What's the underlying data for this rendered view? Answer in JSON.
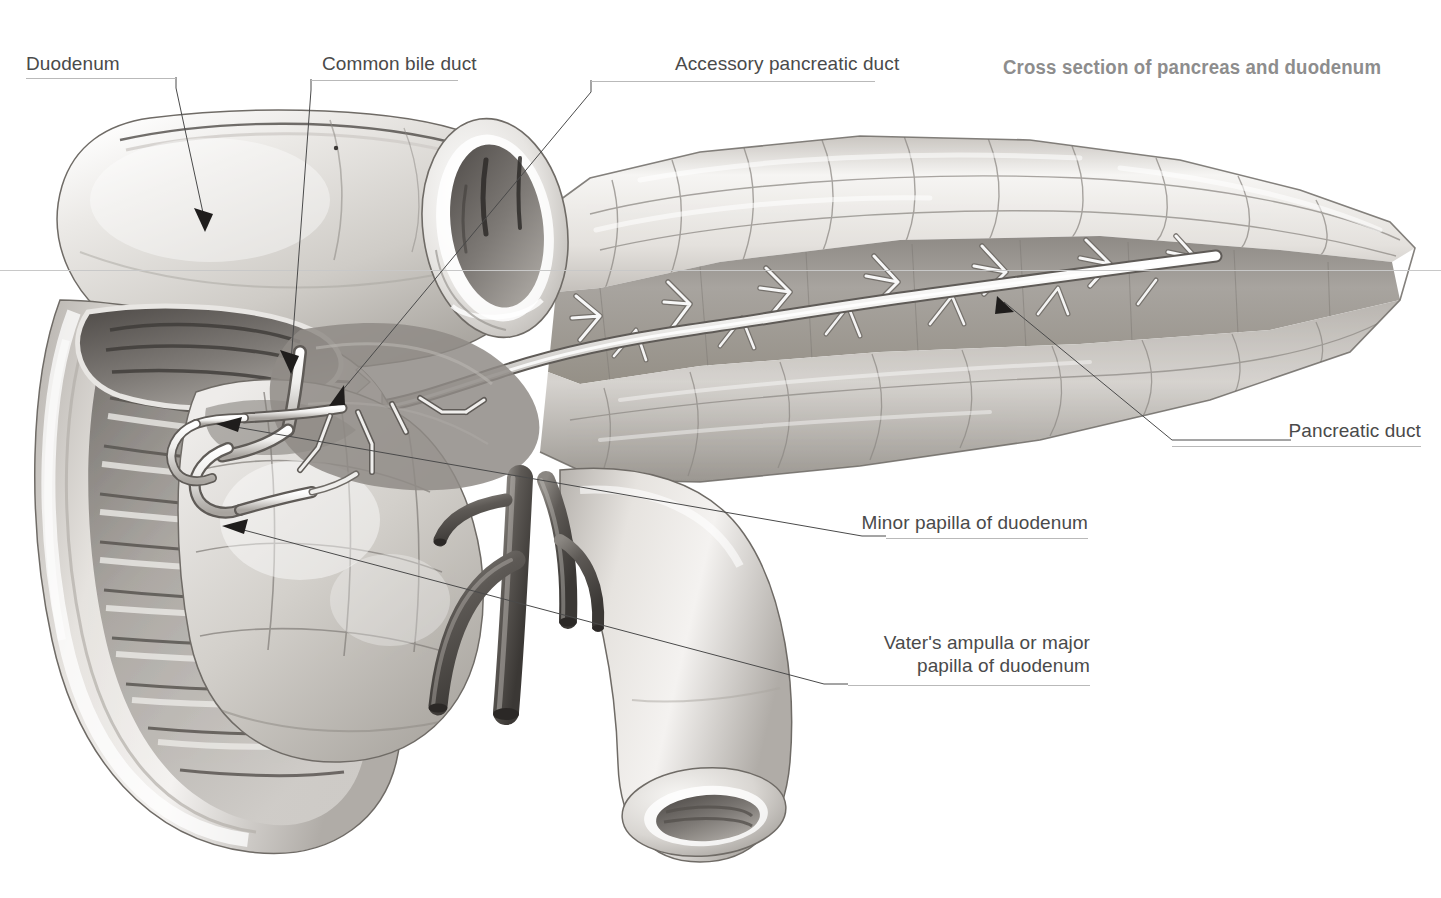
{
  "figure": {
    "title": "Cross section of pancreas and duodenum",
    "title_color": "#8d8d8d",
    "label_color": "#4a4a4a",
    "rule_color": "#b9b9b9",
    "background": "#ffffff",
    "ink": "#2b2b2b",
    "type": "anatomical-illustration",
    "subject": "pancreas and duodenum"
  },
  "labels": [
    {
      "id": "duodenum",
      "text": "Duodenum",
      "text2": ""
    },
    {
      "id": "common-bile-duct",
      "text": "Common bile duct",
      "text2": ""
    },
    {
      "id": "accessory-pancreatic-duct",
      "text": "Accessory pancreatic duct",
      "text2": ""
    },
    {
      "id": "pancreatic-duct",
      "text": "Pancreatic duct",
      "text2": ""
    },
    {
      "id": "minor-papilla",
      "text": "Minor papilla of duodenum",
      "text2": ""
    },
    {
      "id": "vaters-ampulla",
      "text": "Vater's ampulla or major",
      "text2": "papilla of duodenum"
    }
  ],
  "structures": [
    {
      "id": "duodenum-bulb",
      "name": "Duodenal bulb / superior part"
    },
    {
      "id": "duodenum-descending",
      "name": "Descending duodenum with circular folds"
    },
    {
      "id": "duodenum-cut-end",
      "name": "Cut end of duodenum"
    },
    {
      "id": "pancreas-head",
      "name": "Head of pancreas"
    },
    {
      "id": "pancreas-body-tail",
      "name": "Body and tail of pancreas"
    },
    {
      "id": "pancreatic-duct-tree",
      "name": "Main pancreatic duct with side branches"
    },
    {
      "id": "accessory-duct",
      "name": "Accessory pancreatic duct (Santorini)"
    },
    {
      "id": "bile-duct",
      "name": "Common bile duct"
    },
    {
      "id": "mesenteric-vessels",
      "name": "Mesenteric vessels"
    }
  ]
}
